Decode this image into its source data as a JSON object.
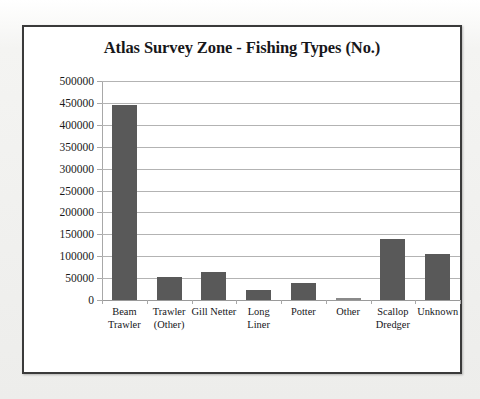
{
  "chart_data": {
    "type": "bar",
    "title": "Atlas Survey Zone - Fishing Types (No.)",
    "xlabel": "",
    "ylabel": "",
    "categories": [
      "Beam Trawler",
      "Trawler (Other)",
      "Gill Netter",
      "Long Liner",
      "Potter",
      "Other",
      "Scallop Dredger",
      "Unknown"
    ],
    "category_lines": [
      [
        "Beam",
        "Trawler"
      ],
      [
        "Trawler",
        "(Other)"
      ],
      [
        "Gill Netter"
      ],
      [
        "Long",
        "Liner"
      ],
      [
        "Potter"
      ],
      [
        "Other"
      ],
      [
        "Scallop",
        "Dredger"
      ],
      [
        "Unknown"
      ]
    ],
    "values": [
      445000,
      52000,
      64000,
      23000,
      38000,
      2000,
      139000,
      106000
    ],
    "ylim": [
      0,
      500000
    ],
    "ytick_step": 50000,
    "ytick_labels": [
      "500000",
      "450000",
      "400000",
      "350000",
      "300000",
      "250000",
      "200000",
      "150000",
      "100000",
      "50000",
      "0"
    ],
    "grid": true,
    "legend": "none",
    "bar_color": "#595959",
    "gridline_color": "#b3b3b3",
    "axis_color": "#a8a8a8",
    "plot_background": "#ffffff",
    "frame_border_color": "#3a3a3a",
    "page_background": "#f2f2f0"
  }
}
